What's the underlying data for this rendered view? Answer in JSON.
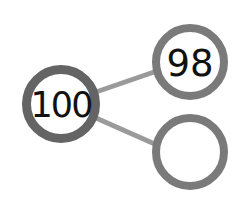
{
  "diagram": {
    "type": "number-bond",
    "whole": {
      "value": "100",
      "cx": 61,
      "cy": 104,
      "r": 34
    },
    "parts": [
      {
        "value": "98",
        "cx": 190,
        "cy": 62,
        "r": 34
      },
      {
        "value": "",
        "cx": 190,
        "cy": 152,
        "r": 34
      }
    ],
    "colors": {
      "whole_stroke": "#646464",
      "part_stroke": "#7a7a7a",
      "connector": "#9a9a9a",
      "fill": "#ffffff",
      "text": "#111111"
    }
  }
}
